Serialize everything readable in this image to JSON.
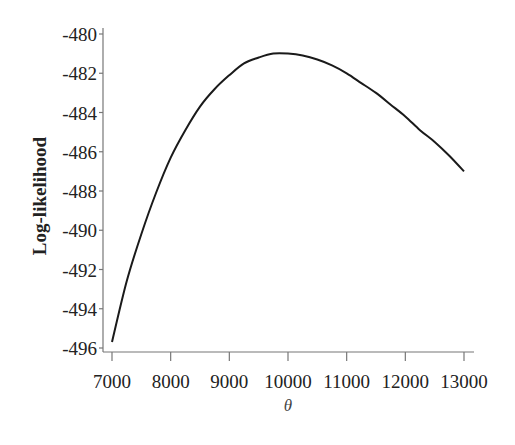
{
  "chart_data": {
    "type": "line",
    "title": "",
    "xlabel": "θ",
    "ylabel": "Log-likelihood",
    "xlim": [
      7000,
      13000
    ],
    "ylim": [
      -496,
      -480
    ],
    "grid": false,
    "legend": null,
    "x_ticks": [
      7000,
      8000,
      9000,
      10000,
      11000,
      12000,
      13000
    ],
    "x_tick_labels": [
      "7000",
      "8000",
      "9000",
      "10000",
      "11000",
      "12000",
      "13000"
    ],
    "y_ticks": [
      -480,
      -482,
      -484,
      -486,
      -488,
      -490,
      -492,
      -494,
      -496
    ],
    "y_tick_labels": [
      "-480",
      "-482",
      "-484",
      "-486",
      "-488",
      "-490",
      "-492",
      "-494",
      "-496"
    ],
    "series": [
      {
        "name": "Log-likelihood",
        "x": [
          7000,
          7250,
          7500,
          7750,
          8000,
          8250,
          8500,
          8750,
          9000,
          9250,
          9500,
          9750,
          10000,
          10250,
          10500,
          10750,
          11000,
          11250,
          11500,
          11750,
          12000,
          12250,
          12500,
          12750,
          13000
        ],
        "values": [
          -495.7,
          -492.6,
          -490.2,
          -488.1,
          -486.3,
          -484.9,
          -483.7,
          -482.8,
          -482.1,
          -481.5,
          -481.2,
          -481.0,
          -481.0,
          -481.1,
          -481.3,
          -481.6,
          -482.0,
          -482.5,
          -483.0,
          -483.6,
          -484.2,
          -484.9,
          -485.5,
          -486.2,
          -487.0
        ]
      }
    ]
  }
}
